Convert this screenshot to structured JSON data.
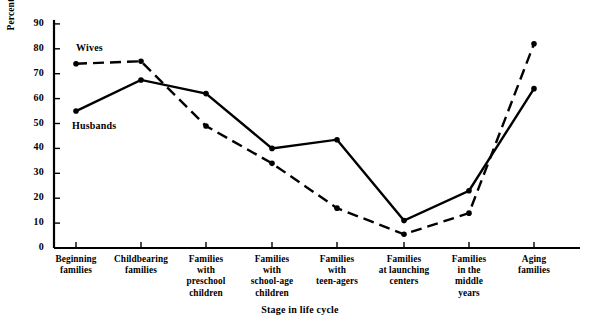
{
  "chart_data": {
    "type": "line",
    "title": "",
    "xlabel": "Stage in life cycle",
    "ylabel": "Percent reporting satisfaction",
    "ylim": [
      0,
      90
    ],
    "yticks": [
      0,
      10,
      20,
      30,
      40,
      50,
      60,
      70,
      80,
      90
    ],
    "grid": false,
    "legend_position": "inline-annotation",
    "categories": [
      "Beginning families",
      "Childbearing families",
      "Families with preschool children",
      "Families with school-age children",
      "Families with teen-agers",
      "Families at launching centers",
      "Families in the middle years",
      "Aging families"
    ],
    "category_lines": [
      [
        "Beginning",
        "families"
      ],
      [
        "Childbearing",
        "families"
      ],
      [
        "Families",
        "with",
        "preschool",
        "children"
      ],
      [
        "Families",
        "with",
        "school-age",
        "children"
      ],
      [
        "Families",
        "with",
        "teen-agers"
      ],
      [
        "Families",
        "at launching",
        "centers"
      ],
      [
        "Families",
        "in the",
        "middle",
        "years"
      ],
      [
        "Aging",
        "families"
      ]
    ],
    "series": [
      {
        "name": "Wives",
        "style": "dashed",
        "color": "#000000",
        "values": [
          74,
          75,
          49,
          34,
          16,
          5.5,
          14,
          82
        ]
      },
      {
        "name": "Husbands",
        "style": "solid",
        "color": "#000000",
        "values": [
          55,
          67.5,
          62,
          40,
          43.5,
          11,
          23,
          64
        ]
      }
    ],
    "annotations": [
      {
        "text": "Wives",
        "series": "Wives"
      },
      {
        "text": "Husbands",
        "series": "Husbands"
      }
    ]
  }
}
